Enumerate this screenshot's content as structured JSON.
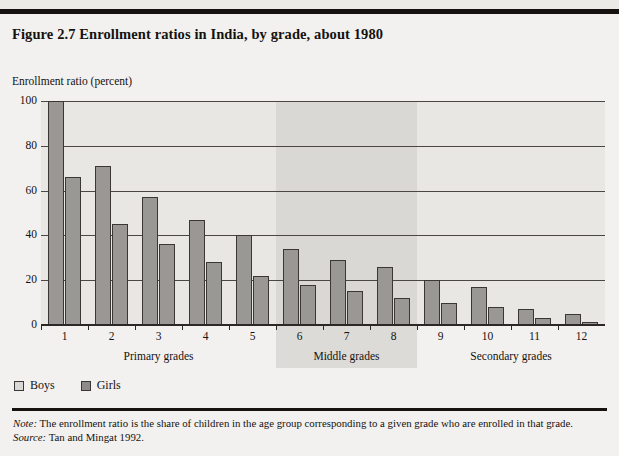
{
  "figure": {
    "title": "Figure 2.7  Enrollment ratios in India, by grade, about 1980",
    "top_sliver_ghost": ""
  },
  "footnotes": {
    "note_label": "Note:",
    "note_text": "The enrollment ratio is the share of children in the age group corresponding to a given grade who are enrolled in that grade.",
    "source_label": "Source:",
    "source_text": "Tan and Mingat 1992."
  },
  "colors": {
    "page_background": "#f2f1ef",
    "plot_background": "#e8e7e4",
    "band_shade": "#d9d8d4",
    "bar_fill": "#9a9894",
    "bar_stroke": "#3a3734",
    "rule": "#15120f"
  },
  "chart_data": {
    "type": "bar",
    "title": "Enrollment ratios in India, by grade, about 1980",
    "ylabel": "Enrollment ratio (percent)",
    "xlabel": "",
    "ylim": [
      0,
      100
    ],
    "yticks": [
      0,
      20,
      40,
      60,
      80,
      100
    ],
    "grid": true,
    "legend_position": "below-axis-left",
    "categories": [
      "1",
      "2",
      "3",
      "4",
      "5",
      "6",
      "7",
      "8",
      "9",
      "10",
      "11",
      "12"
    ],
    "series": [
      {
        "name": "Boys",
        "values": [
          100,
          71,
          57,
          47,
          40,
          34,
          29,
          26,
          20,
          17,
          7,
          5
        ]
      },
      {
        "name": "Girls",
        "values": [
          66,
          45,
          36,
          28,
          22,
          18,
          15,
          12,
          10,
          8,
          3,
          1.5
        ]
      }
    ],
    "groups": [
      {
        "label": "Primary grades",
        "from": "1",
        "to": "5",
        "shaded": false
      },
      {
        "label": "Middle grades",
        "from": "6",
        "to": "8",
        "shaded": true
      },
      {
        "label": "Secondary grades",
        "from": "9",
        "to": "12",
        "shaded": false
      }
    ]
  }
}
